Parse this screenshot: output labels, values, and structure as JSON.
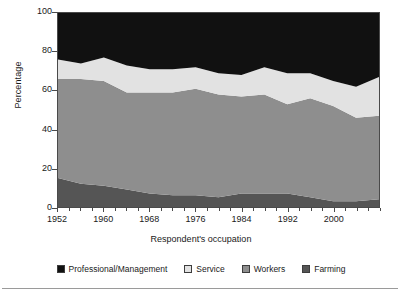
{
  "axes": {
    "ylabel": "Percentage",
    "xlabel": "Respondent's occupation",
    "yticks": [
      "0",
      "20",
      "40",
      "60",
      "80",
      "100"
    ],
    "ytick_values": [
      0,
      20,
      40,
      60,
      80,
      100
    ],
    "xticks": [
      "1952",
      "1960",
      "1968",
      "1976",
      "1984",
      "1992",
      "2000"
    ],
    "xtick_values": [
      1952,
      1960,
      1968,
      1976,
      1984,
      1992,
      2000
    ],
    "xminor_values": [
      1954,
      1956,
      1958,
      1962,
      1964,
      1966,
      1970,
      1972,
      1974,
      1978,
      1980,
      1982,
      1986,
      1988,
      1990,
      1994,
      1996,
      1998,
      2002,
      2004,
      2006,
      2008
    ]
  },
  "legend": {
    "items": [
      {
        "label": "Professional/Management",
        "color": "#111111"
      },
      {
        "label": "Service",
        "color": "#e2e2e2"
      },
      {
        "label": "Workers",
        "color": "#8e8e8e"
      },
      {
        "label": "Farming",
        "color": "#555555"
      }
    ]
  },
  "colors": {
    "professional": "#111111",
    "service": "#e2e2e2",
    "workers": "#8e8e8e",
    "farming": "#555555",
    "axis": "#4a4a4a",
    "rule": "#9a9a9a",
    "background": "#ffffff"
  },
  "chart_data": {
    "type": "area",
    "stacked": true,
    "title": "",
    "xlabel": "Respondent's occupation",
    "ylabel": "Percentage",
    "xlim": [
      1952,
      2008
    ],
    "ylim": [
      0,
      100
    ],
    "grid": false,
    "legend_position": "bottom",
    "x": [
      1952,
      1956,
      1960,
      1964,
      1968,
      1972,
      1976,
      1980,
      1984,
      1988,
      1992,
      1996,
      2000,
      2004,
      2008
    ],
    "series": [
      {
        "name": "Farming",
        "color": "#555555",
        "values": [
          15,
          12,
          11,
          9,
          7,
          6,
          6,
          5,
          7,
          7,
          7,
          5,
          3,
          3,
          4
        ]
      },
      {
        "name": "Workers",
        "color": "#8e8e8e",
        "values": [
          51,
          54,
          54,
          50,
          52,
          53,
          55,
          53,
          50,
          51,
          46,
          51,
          49,
          43,
          43
        ]
      },
      {
        "name": "Service",
        "color": "#e2e2e2",
        "values": [
          10,
          8,
          12,
          14,
          12,
          12,
          11,
          11,
          11,
          14,
          16,
          13,
          13,
          16,
          20
        ]
      },
      {
        "name": "Professional/Management",
        "color": "#111111",
        "values": [
          24,
          26,
          23,
          27,
          29,
          29,
          28,
          31,
          32,
          28,
          31,
          31,
          35,
          38,
          33
        ]
      }
    ],
    "cumulative_boundaries": {
      "farming_top": [
        15,
        12,
        11,
        9,
        7,
        6,
        6,
        5,
        7,
        7,
        7,
        5,
        3,
        3,
        4
      ],
      "workers_top": [
        66,
        66,
        65,
        59,
        59,
        59,
        61,
        58,
        57,
        58,
        53,
        56,
        52,
        46,
        47
      ],
      "service_top": [
        76,
        74,
        77,
        73,
        71,
        71,
        72,
        69,
        68,
        72,
        69,
        69,
        65,
        62,
        67
      ],
      "professional_top": [
        100,
        100,
        100,
        100,
        100,
        100,
        100,
        100,
        100,
        100,
        100,
        100,
        100,
        100,
        100
      ]
    }
  }
}
